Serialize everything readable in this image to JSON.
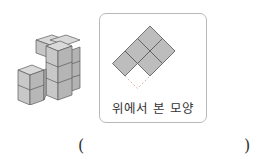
{
  "figure": {
    "stack_description": "isometric cube stack",
    "topview_caption": "위에서 본 모양"
  },
  "answer": {
    "open_paren": "(",
    "close_paren": ")",
    "value": ""
  },
  "colors": {
    "cube_top": "#d6d6d6",
    "cube_front": "#c4c4c4",
    "cube_side": "#b0b0b0",
    "edge": "#555555",
    "card_border": "#b8b8b8",
    "topview_fill": "#bdbdbd"
  }
}
